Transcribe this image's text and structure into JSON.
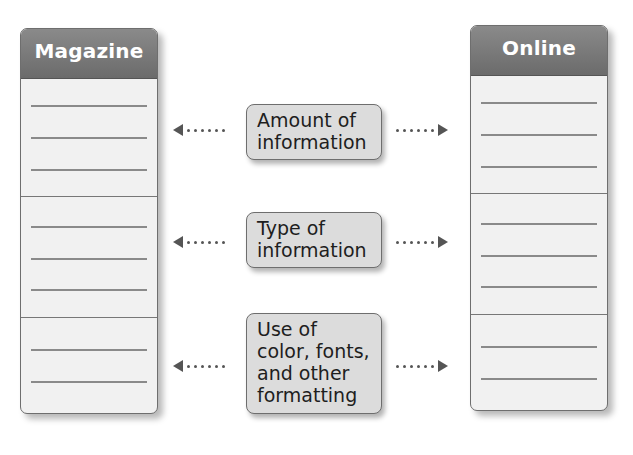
{
  "left_panel": {
    "title": "Magazine"
  },
  "right_panel": {
    "title": "Online"
  },
  "comparisons": [
    {
      "label": "Amount of information"
    },
    {
      "label": "Type of information"
    },
    {
      "label": "Use of color, fonts, and other formatting"
    }
  ],
  "colors": {
    "header": "#7a7a7a",
    "panel_body": "#f1f1f1",
    "box_fill": "#dcdcdc",
    "arrow": "#555555"
  }
}
